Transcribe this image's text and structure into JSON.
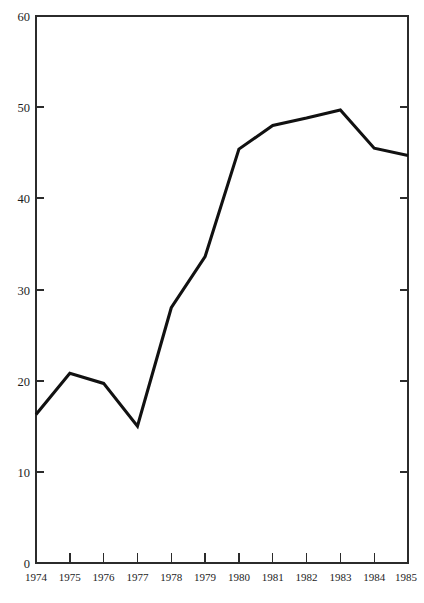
{
  "chart_data": {
    "type": "line",
    "title": "",
    "subtitle": "",
    "xlabel": "",
    "ylabel": "",
    "x": [
      1974,
      1975,
      1976,
      1977,
      1978,
      1979,
      1980,
      1981,
      1982,
      1983,
      1984,
      1985
    ],
    "values": [
      16.3,
      20.8,
      19.7,
      15.0,
      28.0,
      33.6,
      45.4,
      48.0,
      48.8,
      49.7,
      45.5,
      44.7
    ],
    "series": [
      {
        "name": "",
        "values": [
          16.3,
          20.8,
          19.7,
          15.0,
          28.0,
          33.6,
          45.4,
          48.0,
          48.8,
          49.7,
          45.5,
          44.7
        ]
      }
    ],
    "xlim": [
      1974,
      1985
    ],
    "ylim": [
      0,
      60
    ],
    "ytick_labels": [
      "0",
      "10",
      "20",
      "30",
      "40",
      "50",
      "60"
    ],
    "ytick_values": [
      0,
      10,
      20,
      30,
      40,
      50,
      60
    ],
    "xtick_labels": [
      "1974",
      "1975",
      "1976",
      "1977",
      "1978",
      "1979",
      "1980",
      "1981",
      "1982",
      "1983",
      "1984",
      "1985"
    ],
    "grid": false,
    "legend": false,
    "legend_position": "none",
    "line_color": "#111111",
    "axis_color": "#2b2b2b",
    "background_color": "#ffffff",
    "annotations": []
  }
}
